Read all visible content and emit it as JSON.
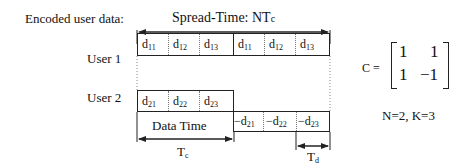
{
  "title_label": "Encoded user data:",
  "spread_label": "Spread-Time:  NT",
  "spread_sub": "c",
  "users": [
    {
      "label": "User  1",
      "cells": [
        {
          "sym": "d",
          "sub": "11"
        },
        {
          "sym": "d",
          "sub": "12"
        },
        {
          "sym": "d",
          "sub": "13"
        },
        {
          "sym": "d",
          "sub": "11"
        },
        {
          "sym": "d",
          "sub": "12"
        },
        {
          "sym": "d",
          "sub": "13"
        }
      ]
    },
    {
      "label": "User 2",
      "cells": [
        {
          "sym": "d",
          "sub": "21"
        },
        {
          "sym": "d",
          "sub": "22"
        },
        {
          "sym": "d",
          "sub": "23"
        },
        {
          "sym": "−d",
          "sub": "21"
        },
        {
          "sym": "−d",
          "sub": "22"
        },
        {
          "sym": "−d",
          "sub": "23"
        }
      ]
    }
  ],
  "data_time_label": "Data Time",
  "tc_label": "T",
  "tc_sub": "c",
  "td_label": "T",
  "td_sub": "d",
  "matrix": {
    "label": "C =",
    "rows": [
      [
        "1",
        "1"
      ],
      [
        "1",
        "−1"
      ]
    ]
  },
  "params": "N=2, K=3",
  "colors": {
    "line": "#222222",
    "text": "#111111",
    "dotted": "#777777"
  }
}
